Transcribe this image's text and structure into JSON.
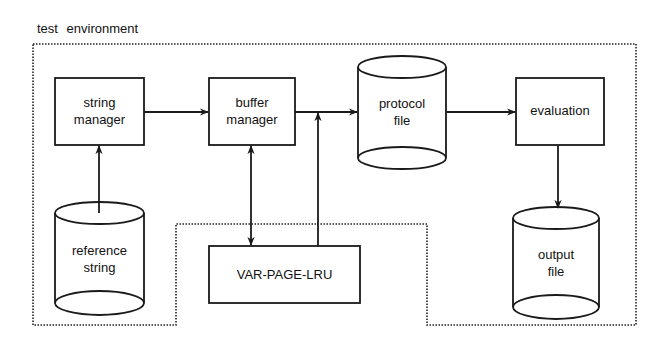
{
  "diagram": {
    "title": "test environment",
    "colors": {
      "line": "#1a1a1a",
      "background": "#ffffff"
    },
    "nodes": [
      {
        "id": "string-manager",
        "shape": "box",
        "lines": [
          "string",
          "manager"
        ]
      },
      {
        "id": "buffer-manager",
        "shape": "box",
        "lines": [
          "buffer",
          "manager"
        ]
      },
      {
        "id": "protocol-file",
        "shape": "cylinder",
        "lines": [
          "protocol",
          "file"
        ]
      },
      {
        "id": "evaluation",
        "shape": "box",
        "lines": [
          "evaluation"
        ]
      },
      {
        "id": "reference-string",
        "shape": "cylinder",
        "lines": [
          "reference",
          "string"
        ]
      },
      {
        "id": "var-page-lru",
        "shape": "box",
        "lines": [
          "VAR-PAGE-LRU"
        ]
      },
      {
        "id": "output-file",
        "shape": "cylinder",
        "lines": [
          "output",
          "file"
        ]
      }
    ],
    "edges": [
      {
        "from": "reference-string",
        "to": "string-manager",
        "type": "directed"
      },
      {
        "from": "string-manager",
        "to": "buffer-manager",
        "type": "directed"
      },
      {
        "from": "buffer-manager",
        "to": "var-page-lru",
        "type": "bidirectional"
      },
      {
        "from": "var-page-lru",
        "to": "buffer-manager-output-line",
        "type": "directed"
      },
      {
        "from": "buffer-manager",
        "to": "protocol-file",
        "type": "directed"
      },
      {
        "from": "protocol-file",
        "to": "evaluation",
        "type": "directed"
      },
      {
        "from": "evaluation",
        "to": "output-file",
        "type": "directed"
      }
    ],
    "boundary": {
      "label": "test environment",
      "style": "dotted",
      "excludes": [
        "var-page-lru"
      ]
    }
  }
}
